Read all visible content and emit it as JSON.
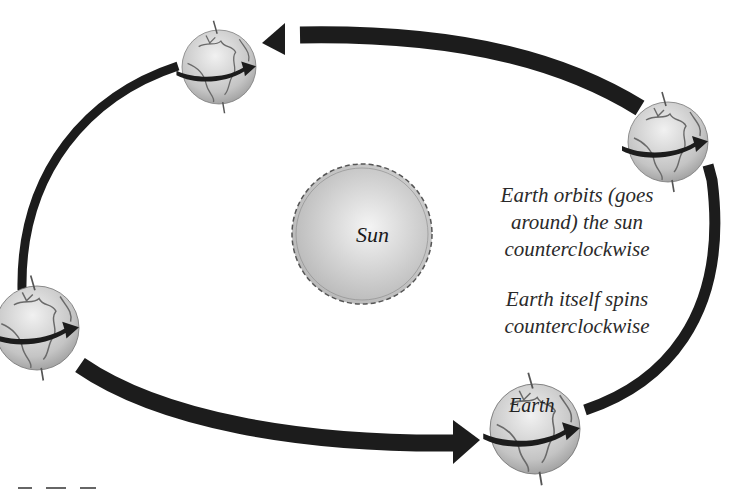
{
  "diagram": {
    "sun": {
      "label": "Sun",
      "fill_center": "#f2f2f2",
      "fill_edge": "#b8b8b8",
      "outline": "#555555"
    },
    "earth_label": "Earth",
    "captions": {
      "orbit": [
        "Earth orbits (goes",
        "around) the sun",
        "counterclockwise"
      ],
      "spin": [
        "Earth itself spins",
        "counterclockwise"
      ]
    },
    "earths": [
      {
        "position": "top",
        "cx": 219,
        "cy": 67,
        "r": 37
      },
      {
        "position": "right",
        "cx": 668,
        "cy": 142,
        "r": 40
      },
      {
        "position": "left",
        "cx": 37,
        "cy": 328,
        "r": 42
      },
      {
        "position": "bottom",
        "cx": 535,
        "cy": 429,
        "r": 45
      }
    ],
    "orbit_arrows": [
      {
        "from": "right",
        "to": "top",
        "direction": "counterclockwise"
      },
      {
        "from": "top",
        "to": "left",
        "direction": "counterclockwise"
      },
      {
        "from": "left",
        "to": "bottom",
        "direction": "counterclockwise"
      },
      {
        "from": "bottom",
        "to": "right",
        "direction": "counterclockwise"
      }
    ],
    "colors": {
      "arrow": "#1c1c1c",
      "globe_land_line": "#6a6a6a",
      "globe_fill": "#c9c9c9",
      "text": "#2a2a2a"
    }
  }
}
